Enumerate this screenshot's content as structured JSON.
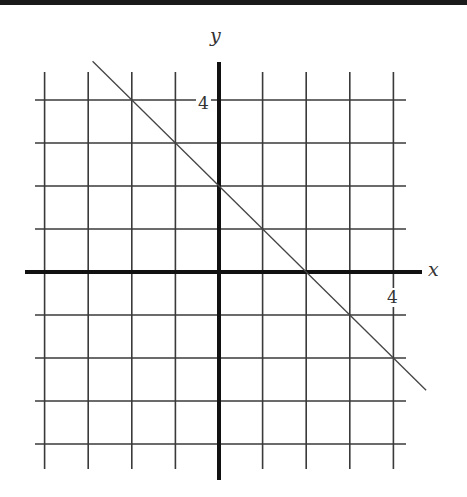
{
  "chart_data": {
    "type": "line",
    "title": "",
    "xlabel": "x",
    "ylabel": "y",
    "xlim": [
      -4,
      4
    ],
    "ylim": [
      -4,
      4
    ],
    "grid": true,
    "tick_labels": {
      "x": [
        "4"
      ],
      "y": [
        "4"
      ]
    },
    "series": [
      {
        "name": "y = -x + 2",
        "slope": -1,
        "intercept": 2,
        "x": [
          -2.9,
          -2,
          0,
          1,
          2,
          3,
          4,
          4.75
        ],
        "y": [
          4.9,
          4,
          2,
          1,
          0,
          -1,
          -2,
          -2.75
        ]
      }
    ]
  },
  "labels": {
    "x_axis": "x",
    "y_axis": "y",
    "x_tick": "4",
    "y_tick": "4"
  },
  "colors": {
    "grid": "#3a3a3a",
    "axis": "#111111",
    "line": "#444444",
    "topbar": "#1a1a1a"
  }
}
